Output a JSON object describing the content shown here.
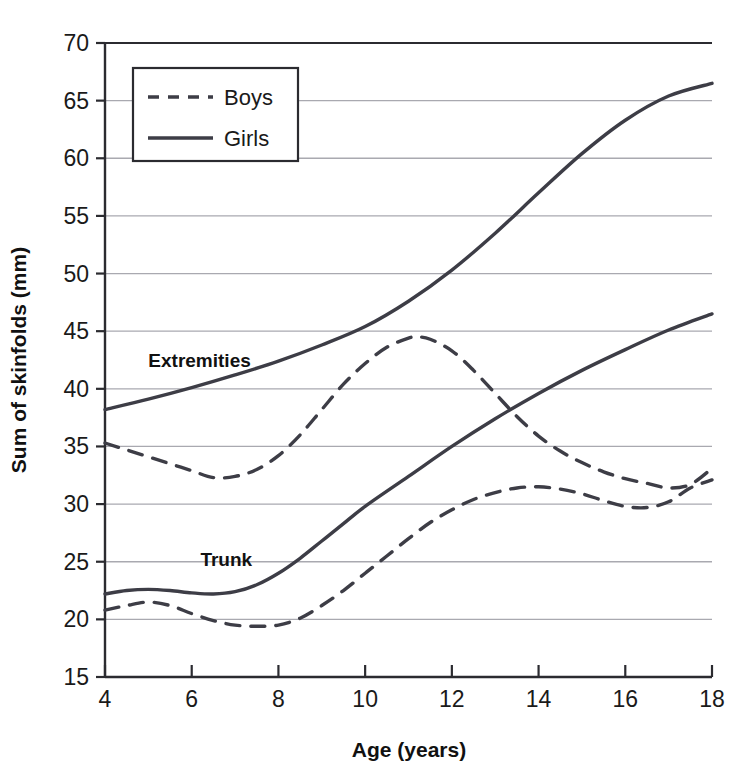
{
  "chart_data": {
    "type": "line",
    "title": "",
    "xlabel": "Age (years)",
    "ylabel": "Sum of skinfolds (mm)",
    "xlim": [
      4,
      18
    ],
    "ylim": [
      15,
      70
    ],
    "xticks": [
      4,
      6,
      8,
      10,
      12,
      14,
      16,
      18
    ],
    "yticks": [
      15,
      20,
      25,
      30,
      35,
      40,
      45,
      50,
      55,
      60,
      65,
      70
    ],
    "grid": "horizontal",
    "legend_position": "top-left-inside",
    "line_color": "#3d3d46",
    "grid_color": "#a9a9b0",
    "axis_color": "#2b2b30",
    "annotations": [
      {
        "text": "Extremities",
        "x": 5.0,
        "y": 41.9
      },
      {
        "text": "Trunk",
        "x": 6.2,
        "y": 24.6
      }
    ],
    "series": [
      {
        "name": "Boys",
        "group": "Extremities",
        "style": "dashed",
        "x": [
          4,
          4.5,
          5,
          5.5,
          6,
          6.5,
          7,
          7.5,
          8,
          8.5,
          9,
          9.5,
          10,
          10.5,
          11,
          11.2,
          11.5,
          12,
          12.5,
          13,
          13.5,
          14,
          14.5,
          15,
          15.5,
          16,
          16.5,
          17,
          17.5,
          18
        ],
        "values": [
          35.3,
          34.7,
          34.1,
          33.5,
          32.9,
          32.3,
          32.4,
          33.0,
          34.2,
          36.0,
          38.2,
          40.4,
          42.2,
          43.6,
          44.4,
          44.5,
          44.3,
          43.3,
          41.6,
          39.6,
          37.6,
          35.9,
          34.6,
          33.6,
          32.8,
          32.2,
          31.8,
          31.4,
          31.7,
          33.1
        ]
      },
      {
        "name": "Girls",
        "group": "Extremities",
        "style": "solid",
        "x": [
          4,
          5,
          6,
          7,
          8,
          9,
          10,
          11,
          12,
          13,
          14,
          15,
          16,
          17,
          18
        ],
        "values": [
          38.2,
          39.1,
          40.1,
          41.2,
          42.4,
          43.8,
          45.4,
          47.6,
          50.3,
          53.5,
          57.0,
          60.4,
          63.3,
          65.4,
          66.5
        ]
      },
      {
        "name": "Boys",
        "group": "Trunk",
        "style": "dashed",
        "x": [
          4,
          4.5,
          5,
          5.5,
          6,
          6.5,
          7,
          7.5,
          8,
          8.5,
          9,
          9.5,
          10,
          10.5,
          11,
          11.5,
          12,
          12.5,
          13,
          13.5,
          14,
          14.5,
          15,
          15.5,
          16,
          16.5,
          17,
          17.5,
          18
        ],
        "values": [
          20.8,
          21.2,
          21.5,
          21.2,
          20.5,
          19.9,
          19.5,
          19.4,
          19.5,
          20.1,
          21.2,
          22.5,
          24.0,
          25.5,
          27.0,
          28.4,
          29.5,
          30.4,
          31.0,
          31.4,
          31.5,
          31.3,
          30.9,
          30.3,
          29.8,
          29.7,
          30.2,
          31.4,
          32.1
        ]
      },
      {
        "name": "Girls",
        "group": "Trunk",
        "style": "solid",
        "x": [
          4,
          4.5,
          5,
          5.5,
          6,
          6.5,
          7,
          7.5,
          8,
          8.5,
          9,
          9.5,
          10,
          11,
          12,
          13,
          14,
          15,
          16,
          17,
          18
        ],
        "values": [
          22.2,
          22.5,
          22.6,
          22.5,
          22.3,
          22.2,
          22.4,
          23.0,
          24.0,
          25.3,
          26.8,
          28.3,
          29.8,
          32.4,
          35.0,
          37.4,
          39.6,
          41.6,
          43.4,
          45.1,
          46.5
        ]
      }
    ]
  },
  "axes": {
    "x_title": "Age (years)",
    "y_title": "Sum of skinfolds (mm)",
    "x_tick_labels": [
      "4",
      "6",
      "8",
      "10",
      "12",
      "14",
      "16",
      "18"
    ],
    "y_tick_labels": [
      "15",
      "20",
      "25",
      "30",
      "35",
      "40",
      "45",
      "50",
      "55",
      "60",
      "65",
      "70"
    ]
  },
  "legend": {
    "entries": [
      {
        "label": "Boys",
        "style": "dashed"
      },
      {
        "label": "Girls",
        "style": "solid"
      }
    ]
  },
  "annotations": {
    "extremities": "Extremities",
    "trunk": "Trunk"
  }
}
